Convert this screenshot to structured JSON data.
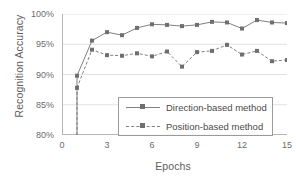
{
  "chart_data": {
    "type": "line",
    "title": "",
    "xlabel": "Epochs",
    "ylabel": "Recognition Accuracy",
    "xlim": [
      0,
      15
    ],
    "ylim": [
      80,
      100
    ],
    "xticks": [
      "0",
      "3",
      "6",
      "9",
      "12",
      "15"
    ],
    "xtick_values": [
      0,
      3,
      6,
      9,
      12,
      15
    ],
    "yticks": [
      "80%",
      "85%",
      "90%",
      "95%",
      "100%"
    ],
    "ytick_values": [
      80,
      85,
      90,
      95,
      100
    ],
    "grid": "horizontal",
    "legend_position": "center-bottom-inside",
    "x": [
      1,
      2,
      3,
      4,
      5,
      6,
      7,
      8,
      9,
      10,
      11,
      12,
      13,
      14,
      15
    ],
    "series": [
      {
        "name": "Direction-based method",
        "line_style": "solid",
        "marker": "square",
        "color": "#808080",
        "values": [
          89.8,
          95.6,
          97.0,
          96.5,
          97.7,
          98.3,
          98.2,
          98.0,
          98.2,
          98.7,
          98.6,
          97.6,
          99.0,
          98.6,
          98.5
        ]
      },
      {
        "name": "Position-based method",
        "line_style": "dashed",
        "marker": "square",
        "color": "#808080",
        "values": [
          87.8,
          94.1,
          93.2,
          93.1,
          93.5,
          93.0,
          93.8,
          91.3,
          93.7,
          93.9,
          94.9,
          93.3,
          93.9,
          92.2,
          92.4
        ]
      }
    ]
  },
  "legend": {
    "items": [
      {
        "label": "Direction-based method"
      },
      {
        "label": "Position-based method"
      }
    ]
  },
  "colors": {
    "axis": "#b5b5b5",
    "grid": "#e2e2e2",
    "line": "#808080",
    "marker": "#6f6f6f",
    "text": "#5e5e5e",
    "tick_text": "#6b6b6b",
    "legend_border": "#9a9a9a",
    "background": "#ffffff"
  }
}
